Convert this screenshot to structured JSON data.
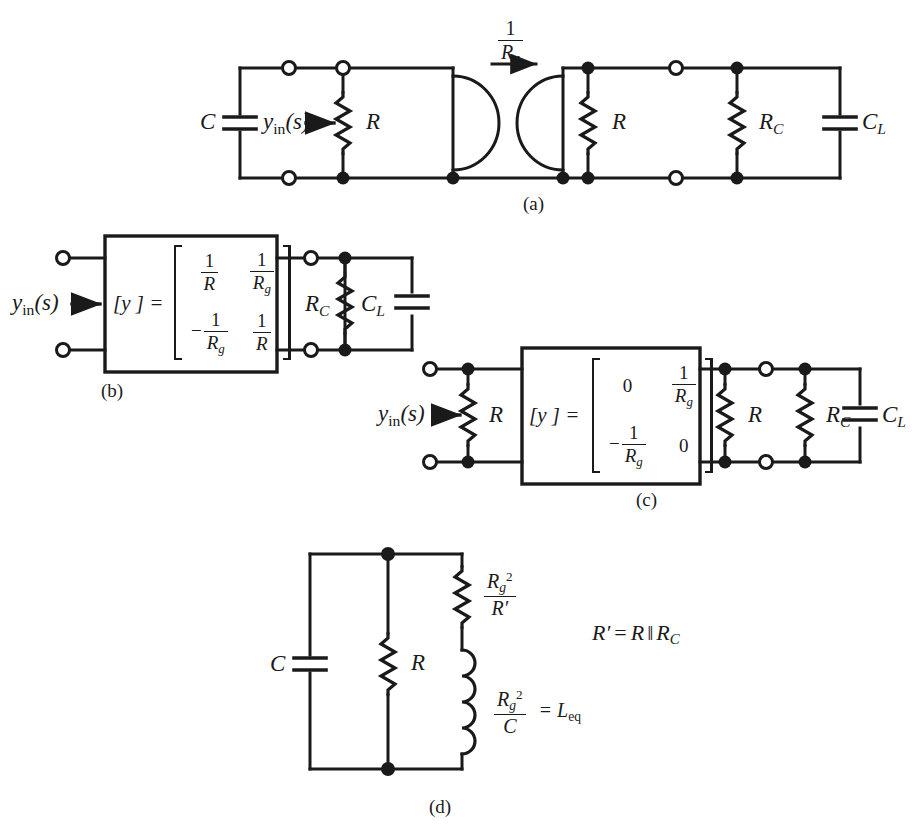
{
  "figure": {
    "kind": "circuit-schematic-figure",
    "background": "#ffffff",
    "ink": "#1a1a1a",
    "panels": [
      {
        "id": "a",
        "label": "(a)"
      },
      {
        "id": "b",
        "label": "(b)"
      },
      {
        "id": "c",
        "label": "(c)"
      },
      {
        "id": "d",
        "label": "(d)"
      }
    ]
  },
  "panel_a": {
    "caption": "(a)",
    "source_cap": "C",
    "input_admittance": "y",
    "input_admittance_sub": "in",
    "input_admittance_arg": "(s)",
    "res_left": "R",
    "gyrator_gain_num": "1",
    "gyrator_gain_den": "R",
    "gyrator_gain_den_sub": "g",
    "res_right": "R",
    "res_load": "R",
    "res_load_sub": "C",
    "cap_load": "C",
    "cap_load_sub": "L"
  },
  "panel_b": {
    "caption": "(b)",
    "input_admittance": "y",
    "input_admittance_sub": "in",
    "input_admittance_arg": "(s)",
    "block_label": "[y ] =",
    "matrix": [
      [
        "1/R",
        "1/Rg"
      ],
      [
        "-1/Rg",
        "1/R"
      ]
    ],
    "matrix_cells": [
      {
        "neg": "",
        "num": "1",
        "den": "R",
        "den_sub": ""
      },
      {
        "neg": "",
        "num": "1",
        "den": "R",
        "den_sub": "g"
      },
      {
        "neg": "−",
        "num": "1",
        "den": "R",
        "den_sub": "g"
      },
      {
        "neg": "",
        "num": "1",
        "den": "R",
        "den_sub": ""
      }
    ],
    "res_load": "R",
    "res_load_sub": "C",
    "cap_load": "C",
    "cap_load_sub": "L"
  },
  "panel_c": {
    "caption": "(c)",
    "input_admittance": "y",
    "input_admittance_sub": "in",
    "input_admittance_arg": "(s)",
    "res_in": "R",
    "block_label": "[y ] =",
    "matrix": [
      [
        "0",
        "1/Rg"
      ],
      [
        "-1/Rg",
        "0"
      ]
    ],
    "matrix_cells": [
      {
        "zero": "0"
      },
      {
        "neg": "",
        "num": "1",
        "den": "R",
        "den_sub": "g"
      },
      {
        "neg": "−",
        "num": "1",
        "den": "R",
        "den_sub": "g"
      },
      {
        "zero": "0"
      }
    ],
    "res_right": "R",
    "res_load": "R",
    "res_load_sub": "C",
    "cap_load": "C",
    "cap_load_sub": "L"
  },
  "panel_d": {
    "caption": "(d)",
    "cap": "C",
    "res": "R",
    "res_eq_num": "R",
    "res_eq_num_sub": "g",
    "res_eq_num_sup": "2",
    "res_eq_den": "R′",
    "ind_eq_num": "R",
    "ind_eq_num_sub": "g",
    "ind_eq_num_sup": "2",
    "ind_eq_den": "C",
    "ind_eq_rhs": "= L",
    "ind_eq_rhs_sub": "eq",
    "note": "R′= R ‖ R",
    "note_sub": "C",
    "note_lhs": "R′",
    "note_eq": "=",
    "note_r": "R",
    "note_par": "‖",
    "note_rc": "R",
    "note_rc_sub": "C"
  }
}
